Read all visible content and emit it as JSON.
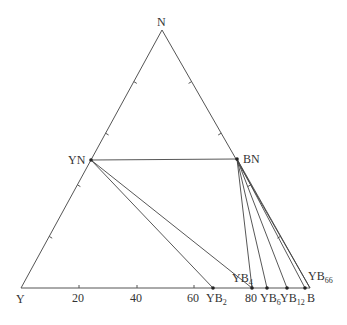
{
  "chart_data": {
    "type": "ternary-phase-diagram",
    "title": "",
    "vertices": {
      "top": {
        "label": "N",
        "x": 162,
        "y": 30
      },
      "left": {
        "label": "Y",
        "x": 21,
        "y": 288
      },
      "right": {
        "label": "B",
        "x": 310,
        "y": 288
      }
    },
    "bottom_axis_ticks": [
      {
        "label": "20",
        "x": 79
      },
      {
        "label": "40",
        "x": 137
      },
      {
        "label": "60",
        "x": 194
      },
      {
        "label": "80",
        "x": 252
      }
    ],
    "side_tick_fractions": [
      0.2,
      0.4,
      0.6,
      0.8
    ],
    "phases": [
      {
        "name": "YN",
        "base": "YN",
        "sub": "",
        "x": 91,
        "y": 160,
        "label_x": 68,
        "label_y": 164
      },
      {
        "name": "BN",
        "base": "BN",
        "sub": "",
        "x": 237,
        "y": 159,
        "label_x": 243,
        "label_y": 163
      },
      {
        "name": "YB2",
        "base": "YB",
        "sub": "2",
        "x": 213,
        "y": 288,
        "label_x": 206,
        "label_y": 302
      },
      {
        "name": "YB4",
        "base": "YB",
        "sub": "4",
        "x": 252,
        "y": 288,
        "label_x": 232,
        "label_y": 282
      },
      {
        "name": "YB6",
        "base": "YB",
        "sub": "6",
        "x": 267,
        "y": 288,
        "label_x": 260,
        "label_y": 302
      },
      {
        "name": "YB12",
        "base": "YB",
        "sub": "12",
        "x": 287,
        "y": 288,
        "label_x": 280,
        "label_y": 302
      },
      {
        "name": "YB66",
        "base": "YB",
        "sub": "66",
        "x": 305,
        "y": 288,
        "label_x": 308,
        "label_y": 280
      }
    ],
    "tie_lines": [
      [
        "YN",
        "BN"
      ],
      [
        "YN",
        "YB2"
      ],
      [
        "YN",
        "YB4"
      ],
      [
        "BN",
        "YB4"
      ],
      [
        "BN",
        "YB6"
      ],
      [
        "BN",
        "YB12"
      ],
      [
        "BN",
        "YB66"
      ],
      [
        "BN",
        "B"
      ]
    ],
    "vertex_label_positions": {
      "N": {
        "x": 157,
        "y": 26
      },
      "Y": {
        "x": 16,
        "y": 303
      },
      "B": {
        "x": 307,
        "y": 302
      }
    }
  }
}
